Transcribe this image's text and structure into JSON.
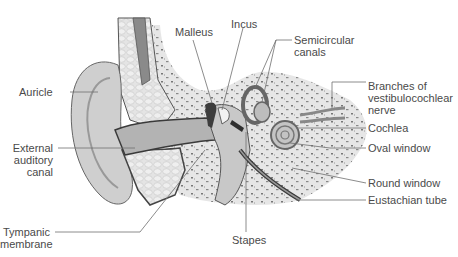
{
  "figure": {
    "type": "anatomical diagram",
    "colors": {
      "line": "#6f6f6f",
      "outline": "#3a3a3a",
      "skin": "#d4d4d4",
      "bone": "#e8e8e8",
      "tissue": "#c2c2c2",
      "canal": "#b0b0b0",
      "text": "#4a4a4a"
    }
  },
  "labels": {
    "malleus": "Malleus",
    "incus": "Incus",
    "semicircular_canals": "Semicircular\ncanals",
    "auricle": "Auricle",
    "branches_nerve": "Branches of\nvestibulocochlear\nnerve",
    "cochlea": "Cochlea",
    "external_auditory_canal": "External\nauditory\ncanal",
    "oval_window": "Oval window",
    "round_window": "Round window",
    "eustachian_tube": "Eustachian tube",
    "tympanic_membrane": "Tympanic\nmembrane",
    "stapes": "Stapes"
  }
}
